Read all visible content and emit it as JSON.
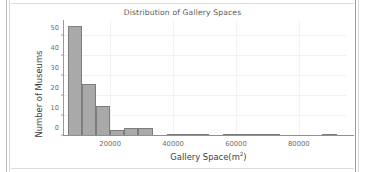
{
  "chart_data": {
    "type": "bar",
    "title": "Distribution of Gallery Spaces",
    "xlabel_text": "Gallery Space(m",
    "xlabel_sup": "2",
    "xlabel_tail": ")",
    "xlabel": "Gallery Space(m2)",
    "ylabel": "Number of Museums",
    "xlim": [
      5000,
      95000
    ],
    "ylim": [
      0,
      58
    ],
    "grid": true,
    "legend": null,
    "bin_width": 4500,
    "xticks": [
      20000,
      40000,
      60000,
      80000
    ],
    "xtick_labels": [
      "20000",
      "40000",
      "60000",
      "80000"
    ],
    "yticks": [
      0,
      10,
      20,
      30,
      40,
      50
    ],
    "ytick_labels": [
      "0",
      "10",
      "20",
      "30",
      "40",
      "50"
    ],
    "bins": [
      {
        "x0": 6500,
        "x1": 11000,
        "value": 55
      },
      {
        "x0": 11000,
        "x1": 15500,
        "value": 26
      },
      {
        "x0": 15500,
        "x1": 20000,
        "value": 15
      },
      {
        "x0": 20000,
        "x1": 24500,
        "value": 3
      },
      {
        "x0": 24500,
        "x1": 29000,
        "value": 4
      },
      {
        "x0": 29000,
        "x1": 33500,
        "value": 4
      },
      {
        "x0": 33500,
        "x1": 38000,
        "value": 0
      },
      {
        "x0": 38000,
        "x1": 42500,
        "value": 1
      },
      {
        "x0": 42500,
        "x1": 47000,
        "value": 1
      },
      {
        "x0": 47000,
        "x1": 51500,
        "value": 1
      },
      {
        "x0": 51500,
        "x1": 56000,
        "value": 0
      },
      {
        "x0": 56000,
        "x1": 60500,
        "value": 1
      },
      {
        "x0": 60500,
        "x1": 65000,
        "value": 1
      },
      {
        "x0": 65000,
        "x1": 69500,
        "value": 1
      },
      {
        "x0": 69500,
        "x1": 74000,
        "value": 1
      },
      {
        "x0": 74000,
        "x1": 78500,
        "value": 0
      },
      {
        "x0": 78500,
        "x1": 83000,
        "value": 0
      },
      {
        "x0": 83000,
        "x1": 87500,
        "value": 0
      },
      {
        "x0": 87500,
        "x1": 92000,
        "value": 1
      }
    ],
    "categories": [
      "6500-11000",
      "11000-15500",
      "15500-20000",
      "20000-24500",
      "24500-29000",
      "29000-33500",
      "33500-38000",
      "38000-42500",
      "42500-47000",
      "47000-51500",
      "51500-56000",
      "56000-60500",
      "60500-65000",
      "65000-69500",
      "69500-74000",
      "74000-78500",
      "78500-83000",
      "83000-87500",
      "87500-92000"
    ],
    "values": [
      55,
      26,
      15,
      3,
      4,
      4,
      0,
      1,
      1,
      1,
      0,
      1,
      1,
      1,
      1,
      0,
      0,
      0,
      1
    ],
    "colors": {
      "bar_fill": "#a9a9a9",
      "bar_edge": "#7d7d7d",
      "grid": "#f0f0f0",
      "axis": "#8f8f8f",
      "title_text": "#5a5a5a",
      "tick_text": "#6e6e6e",
      "axis_label_text": "#3d3d3d",
      "background": "#ffffff"
    }
  }
}
